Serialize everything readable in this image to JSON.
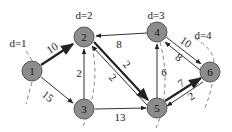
{
  "diagram": {
    "type": "weighted-directed-graph",
    "nodes": [
      {
        "id": "1",
        "label": "1",
        "x": 32,
        "y": 71
      },
      {
        "id": "2",
        "label": "2",
        "x": 84,
        "y": 37
      },
      {
        "id": "3",
        "label": "3",
        "x": 84,
        "y": 109
      },
      {
        "id": "4",
        "label": "4",
        "x": 157,
        "y": 32
      },
      {
        "id": "5",
        "label": "5",
        "x": 157,
        "y": 108
      },
      {
        "id": "6",
        "label": "6",
        "x": 210,
        "y": 72
      }
    ],
    "edges": [
      {
        "from": "1",
        "to": "2",
        "weight": "10",
        "bold": true
      },
      {
        "from": "1",
        "to": "3",
        "weight": "15",
        "bold": false
      },
      {
        "from": "3",
        "to": "2",
        "weight": "2",
        "bold": false
      },
      {
        "from": "4",
        "to": "2",
        "weight": "8",
        "bold": false
      },
      {
        "from": "2",
        "to": "5",
        "weight": "2",
        "bold": true
      },
      {
        "from": "5",
        "to": "2",
        "weight": "2",
        "bold": false
      },
      {
        "from": "3",
        "to": "5",
        "weight": "13",
        "bold": false
      },
      {
        "from": "5",
        "to": "4",
        "weight": "6",
        "bold": false
      },
      {
        "from": "4",
        "to": "6",
        "weight": "10",
        "bold": false
      },
      {
        "from": "6",
        "to": "4",
        "weight": "8",
        "bold": false
      },
      {
        "from": "5",
        "to": "6",
        "weight": "7",
        "bold": true
      },
      {
        "from": "6",
        "to": "5",
        "weight": "2",
        "bold": false
      }
    ],
    "distance_labels": [
      {
        "text": "d=1",
        "x": 18,
        "y": 43
      },
      {
        "text": "d=2",
        "x": 84,
        "y": 15
      },
      {
        "text": "d=3",
        "x": 156,
        "y": 15
      },
      {
        "text": "d=4",
        "x": 203,
        "y": 35
      }
    ]
  }
}
